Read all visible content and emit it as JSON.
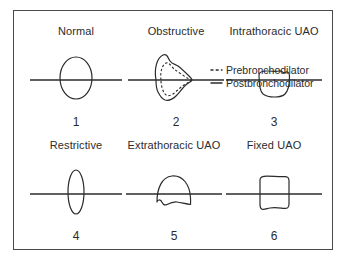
{
  "figure": {
    "type": "medical-diagram",
    "border_color": "#4a4a4a",
    "background_color": "#ffffff",
    "curve_color": "#2b2b2b"
  },
  "legend": {
    "items": [
      {
        "label": "Prebronchodilator",
        "style": "dashed",
        "marker": "dashed-line-icon"
      },
      {
        "label": "Postbronchodilator",
        "style": "solid",
        "marker": "solid-line-icon"
      }
    ]
  },
  "panels": [
    {
      "title": "Normal",
      "number": "1",
      "shape": "ellipse-centered"
    },
    {
      "title": "Obstructive",
      "number": "2",
      "shape": "scooped-loop-dual-curve"
    },
    {
      "title": "Intrathoracic UAO",
      "number": "3",
      "shape": "flat-top-below-axis"
    },
    {
      "title": "Restrictive",
      "number": "4",
      "shape": "narrow-tall-ellipse"
    },
    {
      "title": "Extrathoracic UAO",
      "number": "5",
      "shape": "dome-scalloped-bottom"
    },
    {
      "title": "Fixed UAO",
      "number": "6",
      "shape": "boxy-flat-both"
    }
  ]
}
